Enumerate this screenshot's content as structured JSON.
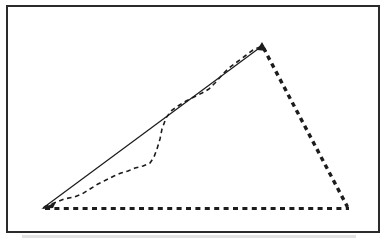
{
  "canvas": {
    "width": 388,
    "height": 241,
    "background": "#ffffff"
  },
  "frame": {
    "x": 7,
    "y": 6,
    "width": 372,
    "height": 226,
    "stroke": "#2b2b2b",
    "stroke_width": 2,
    "fill": "#ffffff"
  },
  "scan_shadow": {
    "x": 22,
    "y": 235,
    "width": 334,
    "height": 3,
    "color": "#d8d8d8",
    "opacity": 0.75
  },
  "figure": {
    "ink_color": "#1c1c1c",
    "vertices": {
      "left": [
        44,
        207
      ],
      "apex": [
        262,
        46
      ],
      "right": [
        347,
        208
      ]
    },
    "edges": [
      {
        "name": "triangle-base-dotted-edge",
        "from": [
          45,
          208.5
        ],
        "to": [
          349,
          208.5
        ],
        "width": 3.2,
        "dash": "5 4.4"
      },
      {
        "name": "triangle-right-dotted-edge",
        "from": [
          263.5,
          48
        ],
        "to": [
          347.5,
          207
        ],
        "width": 3.4,
        "dash": "4.6 4.2"
      },
      {
        "name": "hypotenuse-solid-line",
        "from": [
          43,
          208
        ],
        "to": [
          262,
          46
        ],
        "width": 1.25,
        "dash": ""
      }
    ],
    "dashed_curve": {
      "width": 1.6,
      "dash": "4.6 3.6",
      "points": [
        [
          44,
          207
        ],
        [
          54,
          203
        ],
        [
          64,
          199
        ],
        [
          74,
          197
        ],
        [
          82,
          194
        ],
        [
          90,
          189
        ],
        [
          98,
          184
        ],
        [
          106,
          180
        ],
        [
          114,
          176
        ],
        [
          121,
          173
        ],
        [
          128,
          171
        ],
        [
          135,
          168
        ],
        [
          143,
          166
        ],
        [
          150,
          163
        ],
        [
          154,
          157
        ],
        [
          157,
          149
        ],
        [
          160,
          139
        ],
        [
          162,
          129
        ],
        [
          166,
          118
        ],
        [
          171,
          111
        ],
        [
          178,
          106
        ],
        [
          186,
          101
        ],
        [
          194,
          97
        ],
        [
          202,
          93
        ],
        [
          209,
          89
        ],
        [
          215,
          83
        ],
        [
          222,
          75
        ],
        [
          229,
          68
        ],
        [
          237,
          62
        ],
        [
          245,
          56
        ],
        [
          253,
          50
        ],
        [
          262,
          46
        ]
      ]
    },
    "vertex_marks": [
      {
        "name": "left-vertex-wedge",
        "points": [
          [
            41,
            209
          ],
          [
            56,
            202
          ],
          [
            53,
            208
          ]
        ]
      },
      {
        "name": "apex-wedge",
        "points": [
          [
            257,
            50
          ],
          [
            262,
            42
          ],
          [
            267,
            51
          ]
        ]
      }
    ]
  }
}
